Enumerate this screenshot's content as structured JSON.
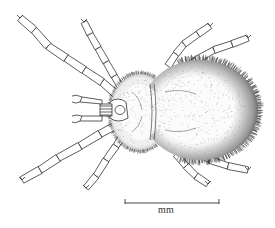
{
  "figure": {
    "scale_bar": {
      "label": "mm"
    },
    "colors": {
      "ink": "#2a2a2a",
      "paper": "#ffffff",
      "dense_hair": "#1a1a1a"
    }
  }
}
